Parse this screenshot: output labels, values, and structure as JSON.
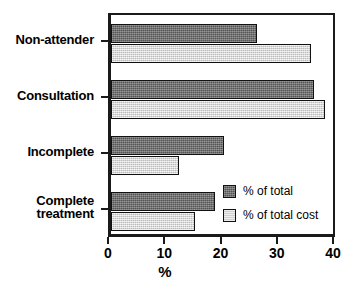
{
  "chart_data": {
    "type": "bar",
    "orientation": "horizontal",
    "title": "",
    "xlabel": "%",
    "ylabel": "",
    "xlim": [
      0,
      40
    ],
    "xticks": [
      0,
      10,
      20,
      30,
      40
    ],
    "xtick_labels": [
      "0",
      "10",
      "20",
      "30",
      "40"
    ],
    "grid": false,
    "legend_position": "inside-bottom-right",
    "categories": [
      "Non-attender",
      "Consultation",
      "Incomplete",
      "Complete treatment"
    ],
    "category_lines": [
      [
        "Non-attender"
      ],
      [
        "Consultation"
      ],
      [
        "Incomplete"
      ],
      [
        "Complete",
        "treatment"
      ]
    ],
    "series": [
      {
        "name": "% of total",
        "color": "#6e6e6e",
        "values": [
          26.0,
          36.0,
          20.0,
          18.5
        ]
      },
      {
        "name": "% of total cost",
        "color": "#d4d4d4",
        "values": [
          35.5,
          38.0,
          12.0,
          15.0
        ]
      }
    ]
  },
  "legend": {
    "items": [
      {
        "label": "% of total"
      },
      {
        "label": "% of total cost"
      }
    ]
  },
  "axis": {
    "x_title": "%"
  },
  "colors": {
    "series_dark": "#6e6e6e",
    "series_light": "#d4d4d4",
    "axis": "#1a1a1a",
    "background": "#ffffff"
  }
}
